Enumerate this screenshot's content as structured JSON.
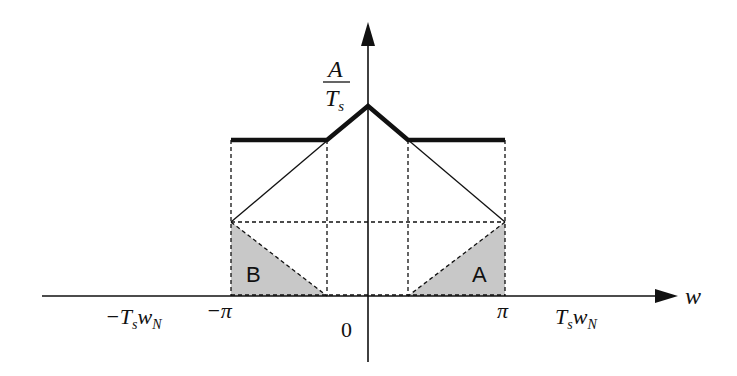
{
  "diagram": {
    "colors": {
      "line": "#111111",
      "fill_shaded": "#c8c8c8",
      "background": "#ffffff"
    },
    "axes": {
      "y_label_numerator": "A",
      "y_label_denominator": "T",
      "y_label_denominator_sub": "s",
      "x_label": "w"
    },
    "ticks": {
      "neg_tsw_prefix": "−T",
      "neg_tsw_sub1": "s",
      "neg_tsw_mid": "w",
      "neg_tsw_sub2": "N",
      "neg_pi": "−π",
      "zero": "0",
      "pi": "π",
      "tsw_prefix": "T",
      "tsw_sub1": "s",
      "tsw_mid": "w",
      "tsw_sub2": "N"
    },
    "regions": {
      "left": "B",
      "right": "A"
    }
  }
}
